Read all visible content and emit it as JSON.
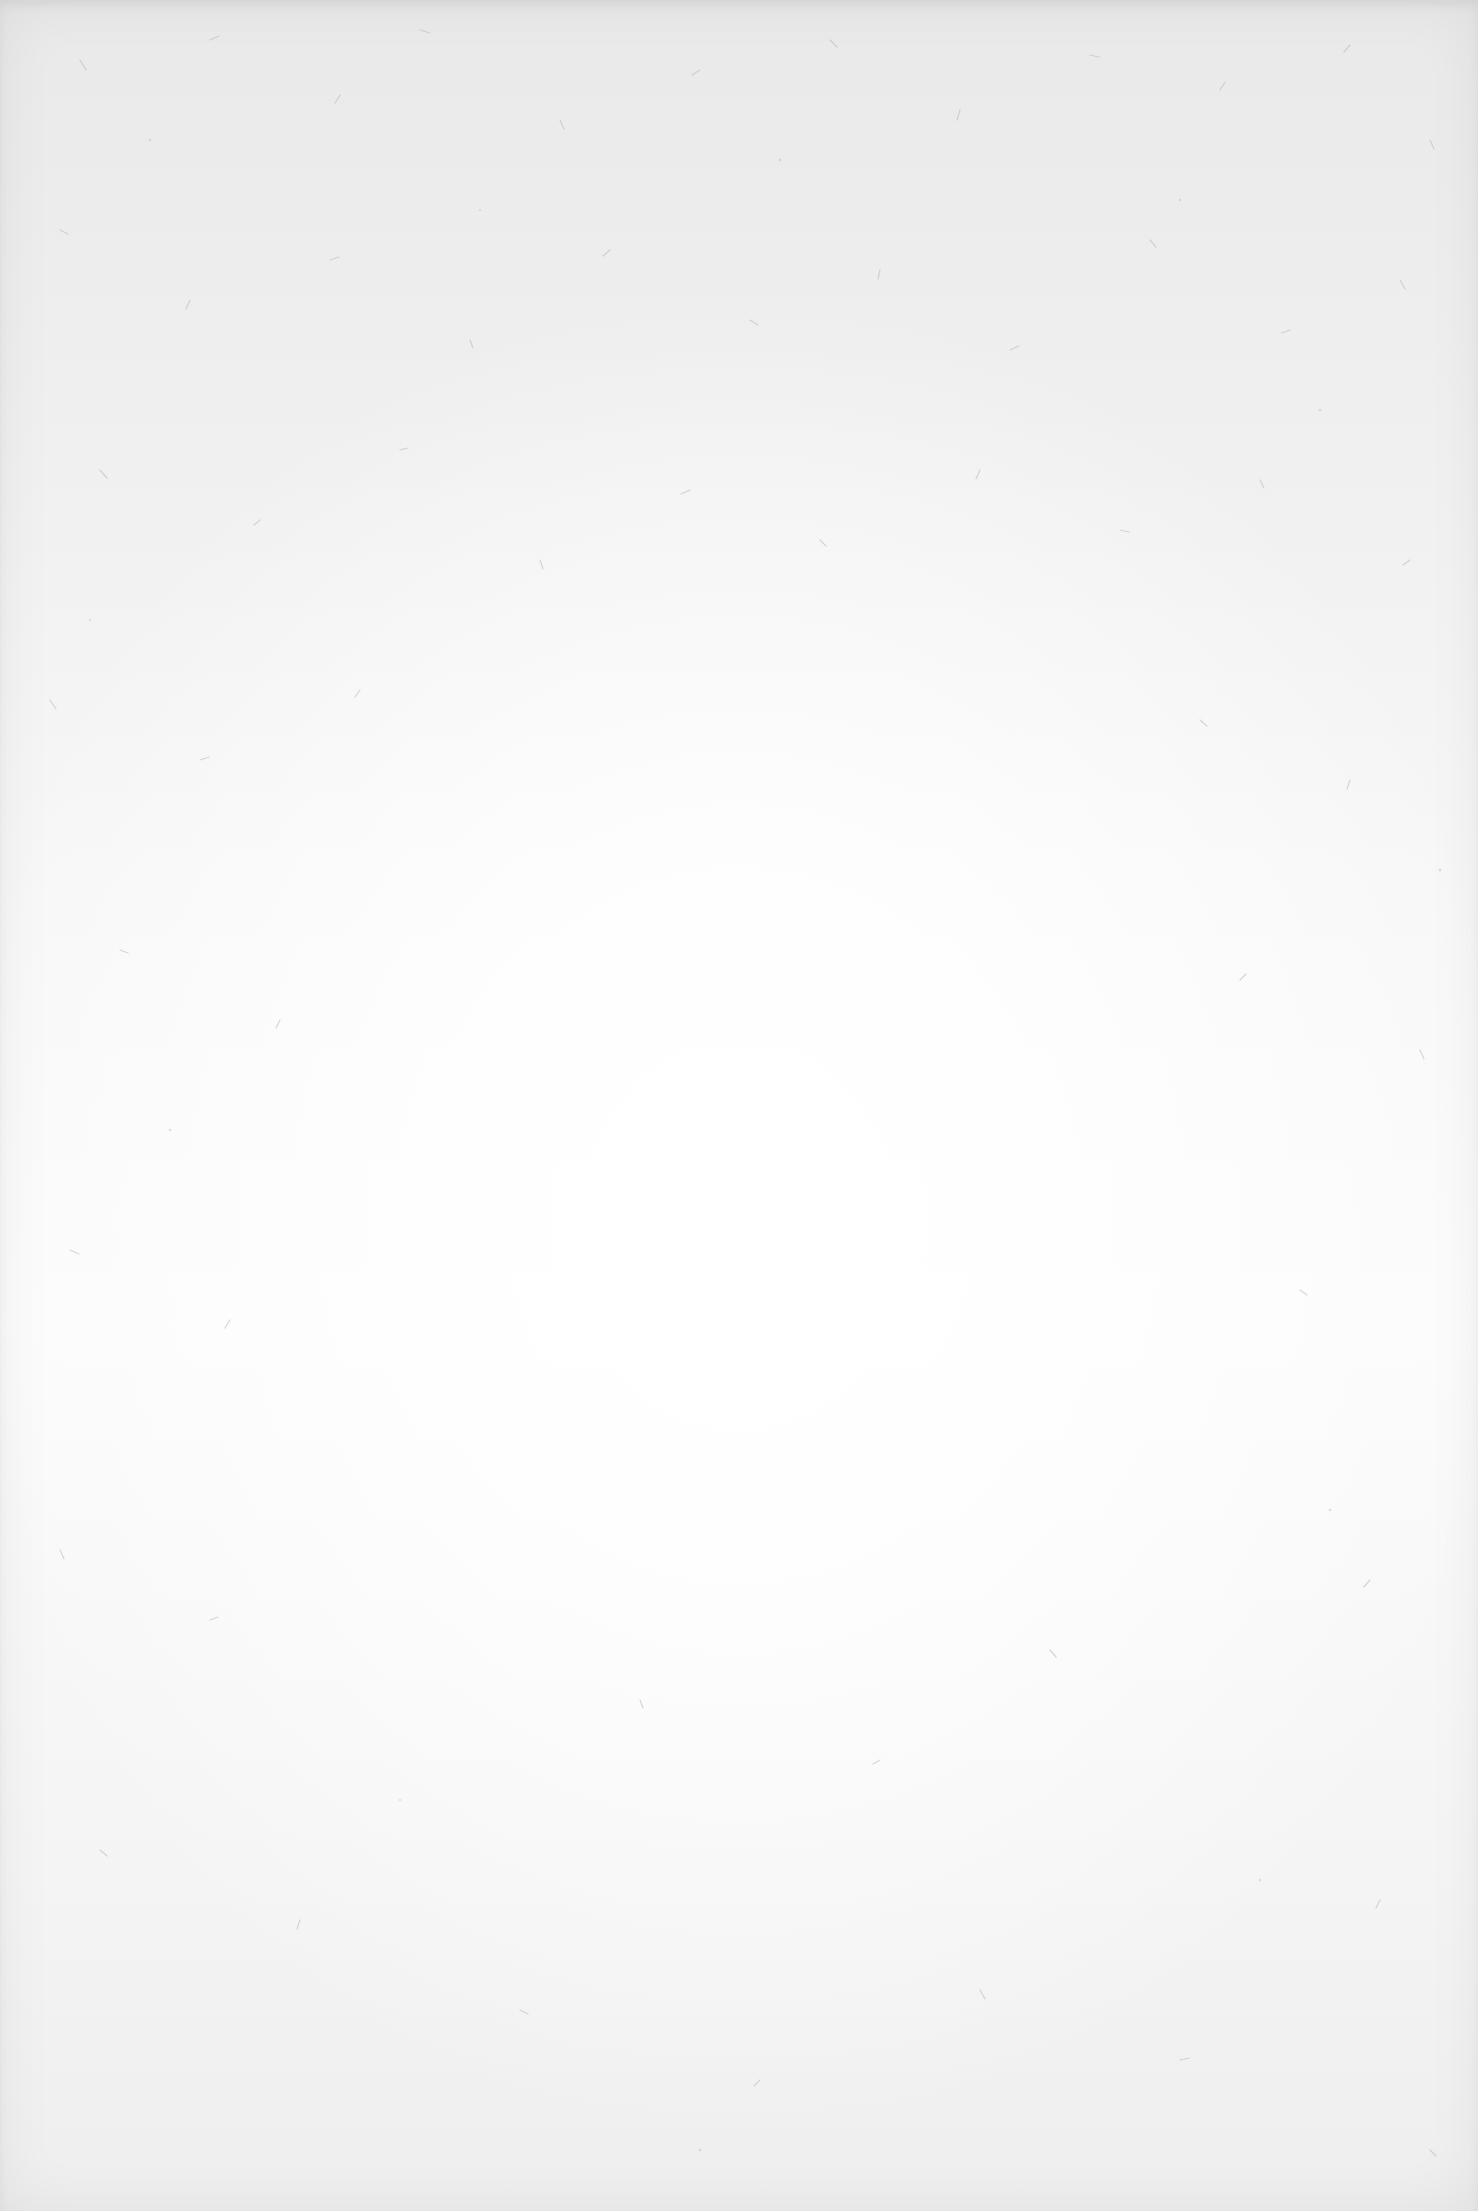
{
  "surface": {
    "type": "paper-texture",
    "colors": {
      "center": "#fdfdfd",
      "edge": "#eaeaea",
      "fiber": "#b8b8b8"
    }
  }
}
